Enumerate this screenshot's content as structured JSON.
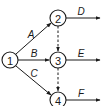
{
  "diagram": {
    "type": "activity-on-arrow network",
    "nodes": [
      {
        "id": "1",
        "label": "1",
        "x": 10,
        "y": 60
      },
      {
        "id": "2",
        "label": "2",
        "x": 58,
        "y": 18
      },
      {
        "id": "3",
        "label": "3",
        "x": 58,
        "y": 60
      },
      {
        "id": "4",
        "label": "4",
        "x": 58,
        "y": 100
      }
    ],
    "edges": [
      {
        "from": "1",
        "to": "2",
        "label": "A",
        "style": "solid"
      },
      {
        "from": "1",
        "to": "3",
        "label": "B",
        "style": "solid"
      },
      {
        "from": "1",
        "to": "4",
        "label": "C",
        "style": "solid"
      },
      {
        "from": "2",
        "to": "3",
        "label": "",
        "style": "dashed"
      },
      {
        "from": "3",
        "to": "4",
        "label": "",
        "style": "dashed"
      },
      {
        "from": "2",
        "to": "out",
        "label": "D",
        "style": "solid"
      },
      {
        "from": "3",
        "to": "out",
        "label": "E",
        "style": "solid"
      },
      {
        "from": "4",
        "to": "out",
        "label": "F",
        "style": "solid"
      }
    ]
  },
  "labels": {
    "node1": "1",
    "node2": "2",
    "node3": "3",
    "node4": "4",
    "edgeA": "A",
    "edgeB": "B",
    "edgeC": "C",
    "edgeD": "D",
    "edgeE": "E",
    "edgeF": "F"
  },
  "colors": {
    "stroke": "#1a1a1a",
    "background": "#ffffff"
  }
}
